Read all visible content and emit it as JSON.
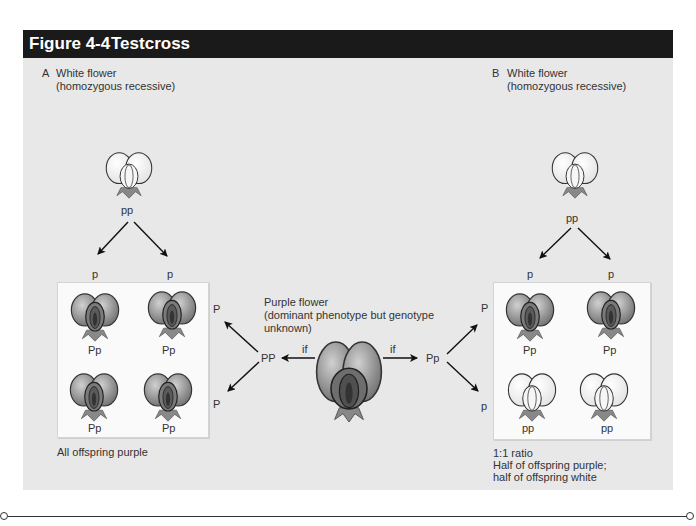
{
  "figure": {
    "number": "Figure 4-4",
    "title": "Testcross"
  },
  "panel_a": {
    "letter": "A",
    "parent_label_line1": "White flower",
    "parent_label_line2": "(homozygous recessive)",
    "parent_genotype": "pp",
    "gametes_top": [
      "p",
      "p"
    ],
    "gametes_side": [
      "P",
      "P"
    ],
    "offspring": [
      "Pp",
      "Pp",
      "Pp",
      "Pp"
    ],
    "offspring_colors": [
      "purple",
      "purple",
      "purple",
      "purple"
    ],
    "result": "All offspring purple"
  },
  "center": {
    "label_line1": "Purple flower",
    "label_line2": "(dominant phenotype but genotype",
    "label_line3": "unknown)",
    "left_if": "if",
    "right_if": "if",
    "left_genotype": "PP",
    "right_genotype": "Pp"
  },
  "panel_b": {
    "letter": "B",
    "parent_label_line1": "White flower",
    "parent_label_line2": "(homozygous recessive)",
    "parent_genotype": "pp",
    "gametes_top": [
      "p",
      "p"
    ],
    "gametes_side": [
      "P",
      "p"
    ],
    "offspring": [
      "Pp",
      "Pp",
      "pp",
      "pp"
    ],
    "offspring_colors": [
      "purple",
      "purple",
      "white",
      "white"
    ],
    "result_line1": "1:1 ratio",
    "result_line2": "Half of offspring purple;",
    "result_line3": "half of offspring white"
  },
  "colors": {
    "header_bg": "#1a1a1a",
    "panel_bg": "#e8e8e8",
    "purple_flower": "#8a8a8a",
    "white_flower": "#f4f4f4"
  }
}
